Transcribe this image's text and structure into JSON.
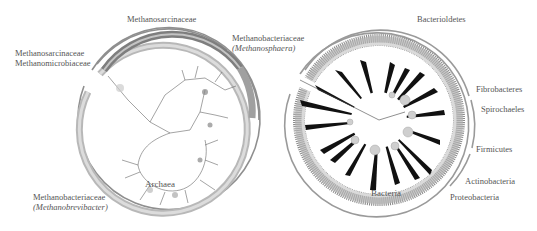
{
  "figure": {
    "panels": [
      {
        "id": "archaea",
        "center_label": "Archaea",
        "labels": [
          {
            "id": "methanosarcinaceae-top",
            "lines": [
              "Methanosarcinaceae"
            ]
          },
          {
            "id": "methanobacteriaceae-methanosphaera",
            "lines": [
              "Methanobacteriaceae",
              "(Methanosphaera)"
            ]
          },
          {
            "id": "methanosarcinaceae-methanomicrobiaceae",
            "lines": [
              "Methanosarcinaceae",
              "Methanomicrobiaceae"
            ]
          },
          {
            "id": "methanobacteriaceae-methanobrevibacter",
            "lines": [
              "Methanobacteriaceae",
              "(Methanobrevibacter)"
            ]
          }
        ]
      },
      {
        "id": "bacteria",
        "center_label": "Bacteria",
        "labels": [
          {
            "id": "bacteroidetes",
            "lines": [
              "Bacterioldetes"
            ]
          },
          {
            "id": "fibrobacteres",
            "lines": [
              "Fibrobacteres"
            ]
          },
          {
            "id": "spirochaetes",
            "lines": [
              "Spirochaeles"
            ]
          },
          {
            "id": "firmicutes",
            "lines": [
              "Firmicutes"
            ]
          },
          {
            "id": "actinobacteria",
            "lines": [
              "Actinobacteria"
            ]
          },
          {
            "id": "proteobacteria",
            "lines": [
              "Proteobacteria"
            ]
          }
        ]
      }
    ]
  },
  "colors": {
    "ring_dark": "#6e6e6e",
    "ring_mid": "#a8a8a8",
    "ring_light": "#d6d6d6",
    "text": "#555555"
  }
}
